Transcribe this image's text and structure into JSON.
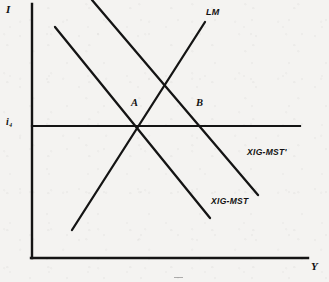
{
  "figure": {
    "kind": "is-lm-macroeconomic-diagram",
    "background_color": "#f4f3f1",
    "ink_color": "#111111"
  },
  "axes": {
    "y_axis": {
      "label": "I",
      "x_px": 32,
      "top_px": 4,
      "bottom_px": 258
    },
    "x_axis": {
      "label": "Y",
      "y_px": 258,
      "left_px": 32,
      "right_px": 308
    }
  },
  "ticks": [
    {
      "name": "interest-rate-tick",
      "label": "i₄",
      "axis": "y",
      "value_px": 126
    }
  ],
  "horizontal_line": {
    "name": "interest-rate-line",
    "y_px": 126,
    "x_start_px": 32,
    "x_end_px": 300
  },
  "curves": [
    {
      "name": "lm-curve",
      "label": "LM",
      "slope": "upward",
      "x1": 72,
      "y1": 230,
      "x2": 205,
      "y2": 22,
      "label_x": 206,
      "label_y": 7
    },
    {
      "name": "is-curve-initial",
      "label": "XIG-MST",
      "slope": "downward",
      "x1": 55,
      "y1": 27,
      "x2": 210,
      "y2": 218,
      "label_x": 211,
      "label_y": 196
    },
    {
      "name": "is-curve-shifted",
      "label": "XIG-MST'",
      "slope": "downward",
      "x1": 92,
      "y1": 0,
      "x2": 258,
      "y2": 195,
      "label_x": 247,
      "label_y": 147
    }
  ],
  "points": [
    {
      "name": "equilibrium-point-a",
      "label": "A",
      "x_px": 137,
      "y_px": 126,
      "label_x": 131,
      "label_y": 97
    },
    {
      "name": "equilibrium-point-b",
      "label": "B",
      "x_px": 200,
      "y_px": 126,
      "label_x": 196,
      "label_y": 97
    }
  ]
}
